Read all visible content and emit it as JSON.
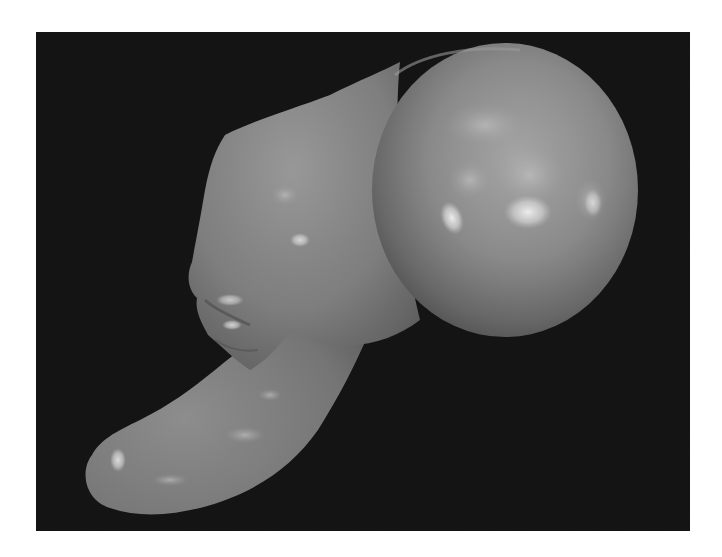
{
  "image": {
    "width": 722,
    "height": 557,
    "page_background": "#ffffff",
    "photo": {
      "background_color": "#101010",
      "frame": {
        "x": 36,
        "y": 32,
        "width": 654,
        "height": 499
      },
      "subject": "gross specimen: smooth spherical cystic mass attached to an elongated, curved tubular tissue structure",
      "palette": {
        "sphere_base": "#8a8a8a",
        "sphere_shadow": "#5a5a5a",
        "tissue_base": "#7d7d7d",
        "tissue_shadow": "#555555",
        "highlight": "#e8e8e8"
      }
    }
  }
}
